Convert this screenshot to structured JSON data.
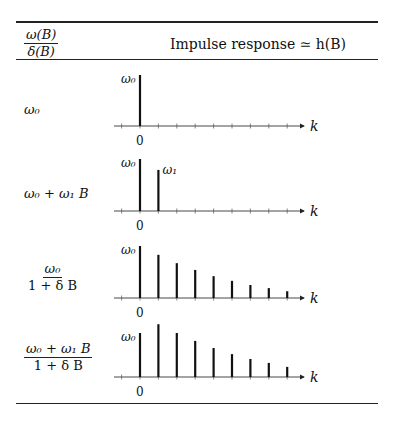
{
  "table": {
    "header": {
      "col1": {
        "numerator": "ω(B)",
        "denominator": "δ(B)"
      },
      "col2": "Impulse response ≃ h(B)"
    },
    "rows": [
      {
        "label_text": "ω₀",
        "type": "plain"
      },
      {
        "label_text": "ω₀ + ω₁ B",
        "type": "plain"
      },
      {
        "numerator": "ω₀",
        "denominator": "1 + δ B",
        "type": "frac"
      },
      {
        "numerator": "ω₀ + ω₁ B",
        "denominator": "1 + δ B",
        "type": "frac"
      }
    ]
  },
  "axis": {
    "x_label": "k",
    "origin_label": "0",
    "peak_label": "ω₀",
    "second_label": "ω₁"
  },
  "chart_data": [
    {
      "type": "bar",
      "title": "ω0",
      "xlabel": "k",
      "categories": [
        0,
        1,
        2,
        3,
        4,
        5,
        6,
        7,
        8
      ],
      "values": [
        1.0,
        0,
        0,
        0,
        0,
        0,
        0,
        0,
        0
      ],
      "annotations": [
        "ω0 at k=0"
      ]
    },
    {
      "type": "bar",
      "title": "ω0 + ω1 B",
      "xlabel": "k",
      "categories": [
        0,
        1,
        2,
        3,
        4,
        5,
        6,
        7,
        8
      ],
      "values": [
        1.0,
        0.79,
        0,
        0,
        0,
        0,
        0,
        0,
        0
      ],
      "annotations": [
        "ω0 at k=0",
        "ω1 at k=1"
      ]
    },
    {
      "type": "bar",
      "title": "ω0 / (1 + δB)",
      "xlabel": "k",
      "categories": [
        0,
        1,
        2,
        3,
        4,
        5,
        6,
        7,
        8
      ],
      "values": [
        1.0,
        0.83,
        0.67,
        0.54,
        0.42,
        0.33,
        0.25,
        0.19,
        0.13
      ],
      "annotations": [
        "ω0 at k=0"
      ]
    },
    {
      "type": "bar",
      "title": "(ω0 + ω1 B) / (1 + δB)",
      "xlabel": "k",
      "categories": [
        0,
        1,
        2,
        3,
        4,
        5,
        6,
        7,
        8
      ],
      "values": [
        1.0,
        1.2,
        1.0,
        0.82,
        0.66,
        0.52,
        0.41,
        0.32,
        0.23
      ],
      "annotations": [
        "ω0 at k=0"
      ]
    }
  ]
}
